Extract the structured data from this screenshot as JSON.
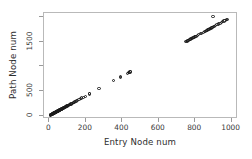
{
  "chart_data": {
    "type": "scatter",
    "title": "",
    "xlabel": "Entry Node num",
    "ylabel": "Path Node num",
    "xlim": [
      -30,
      1035
    ],
    "ylim": [
      -70,
      2080
    ],
    "xticks": [
      0,
      200,
      400,
      600,
      800,
      1000
    ],
    "xticklabels": [
      "0",
      "200",
      "400",
      "600",
      "800",
      "1000"
    ],
    "yticks": [
      0,
      500,
      1000,
      1500,
      2000
    ],
    "yticklabels": [
      "0",
      "500",
      "",
      "1500",
      ""
    ],
    "grid": false,
    "legend": null,
    "marker": "open-circle",
    "marker_color": "#1a1a1a",
    "series": [
      {
        "name": "nodes",
        "x": [
          4,
          6,
          7,
          9,
          10,
          11,
          12,
          13,
          14,
          15,
          16,
          17,
          18,
          19,
          20,
          21,
          22,
          23,
          24,
          25,
          26,
          27,
          28,
          29,
          30,
          31,
          32,
          33,
          34,
          35,
          36,
          37,
          38,
          39,
          40,
          41,
          42,
          43,
          44,
          45,
          46,
          47,
          48,
          49,
          50,
          51,
          52,
          53,
          54,
          55,
          56,
          57,
          58,
          59,
          60,
          61,
          62,
          63,
          64,
          65,
          66,
          67,
          68,
          70,
          72,
          74,
          76,
          78,
          80,
          82,
          84,
          86,
          88,
          90,
          92,
          94,
          96,
          98,
          100,
          103,
          106,
          109,
          112,
          115,
          118,
          122,
          126,
          130,
          134,
          138,
          143,
          148,
          155,
          162,
          170,
          178,
          186,
          196,
          218,
          222,
          272,
          352,
          388,
          392,
          430,
          434,
          438,
          442,
          446,
          748,
          752,
          756,
          760,
          764,
          768,
          772,
          776,
          780,
          784,
          788,
          792,
          796,
          800,
          804,
          812,
          820,
          828,
          836,
          844,
          852,
          856,
          860,
          864,
          868,
          872,
          876,
          880,
          884,
          888,
          892,
          896,
          900,
          904,
          912,
          920,
          928,
          936,
          944,
          952,
          958,
          964,
          970,
          976
        ],
        "y": [
          8,
          12,
          14,
          18,
          20,
          22,
          24,
          26,
          28,
          30,
          32,
          34,
          36,
          38,
          40,
          42,
          44,
          46,
          48,
          50,
          52,
          54,
          56,
          58,
          60,
          62,
          64,
          66,
          68,
          70,
          72,
          74,
          76,
          78,
          80,
          82,
          84,
          86,
          88,
          90,
          92,
          94,
          96,
          98,
          100,
          102,
          104,
          106,
          108,
          110,
          112,
          114,
          116,
          118,
          120,
          122,
          124,
          126,
          128,
          130,
          132,
          134,
          136,
          140,
          144,
          148,
          152,
          156,
          160,
          164,
          168,
          172,
          176,
          180,
          184,
          188,
          192,
          196,
          200,
          206,
          212,
          218,
          224,
          230,
          236,
          244,
          252,
          260,
          268,
          276,
          286,
          296,
          310,
          324,
          340,
          356,
          372,
          392,
          436,
          444,
          544,
          704,
          776,
          784,
          860,
          868,
          876,
          884,
          892,
          1496,
          1504,
          1512,
          1520,
          1528,
          1536,
          1544,
          1552,
          1560,
          1568,
          1576,
          1584,
          1592,
          1600,
          1608,
          1624,
          1640,
          1656,
          1672,
          1688,
          1704,
          1712,
          1720,
          1728,
          1736,
          1744,
          1752,
          1760,
          1768,
          1776,
          1784,
          1792,
          1800,
          1808,
          1824,
          1840,
          1856,
          1872,
          1888,
          1904,
          1916,
          1928,
          1940,
          1952
        ]
      },
      {
        "name": "outlier",
        "x": [
          898
        ],
        "y": [
          2010
        ]
      }
    ]
  },
  "axes": {
    "xlabel": "Entry Node num",
    "ylabel": "Path Node num"
  }
}
